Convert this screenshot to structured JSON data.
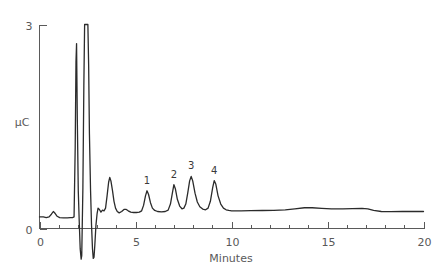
{
  "chart_data": {
    "type": "line",
    "title": "",
    "subtitle": "",
    "xlabel": "Minutes",
    "ylabel": "µC",
    "xlim": [
      0,
      20
    ],
    "ylim": [
      0,
      3
    ],
    "grid": false,
    "legend_position": "none",
    "x_ticks_major": [
      0,
      5,
      10,
      15,
      20
    ],
    "x_tick_labels": [
      "0",
      "5",
      "10",
      "15",
      "20"
    ],
    "x_ticks_minor_step": 1,
    "y_ticks_major": [
      0,
      3
    ],
    "y_tick_labels": [
      "0",
      "3"
    ],
    "series": [
      {
        "name": "detector-response",
        "units": "µC",
        "points": [
          [
            0.0,
            0.17
          ],
          [
            0.2,
            0.17
          ],
          [
            0.35,
            0.16
          ],
          [
            0.5,
            0.17
          ],
          [
            0.62,
            0.21
          ],
          [
            0.72,
            0.25
          ],
          [
            0.82,
            0.22
          ],
          [
            0.92,
            0.18
          ],
          [
            1.05,
            0.16
          ],
          [
            1.25,
            0.155
          ],
          [
            1.45,
            0.155
          ],
          [
            1.6,
            0.16
          ],
          [
            1.72,
            0.16
          ],
          [
            1.8,
            0.17
          ],
          [
            1.86,
            1.2
          ],
          [
            1.9,
            2.45
          ],
          [
            1.93,
            2.72
          ],
          [
            1.97,
            1.6
          ],
          [
            2.02,
            0.55
          ],
          [
            2.07,
            0.1
          ],
          [
            2.12,
            -0.3
          ],
          [
            2.17,
            -0.45
          ],
          [
            2.2,
            -0.4
          ],
          [
            2.26,
            0.6
          ],
          [
            2.31,
            2.1
          ],
          [
            2.35,
            3.0
          ],
          [
            2.52,
            3.0
          ],
          [
            2.56,
            2.4
          ],
          [
            2.6,
            1.4
          ],
          [
            2.66,
            0.55
          ],
          [
            2.71,
            0.05
          ],
          [
            2.76,
            -0.3
          ],
          [
            2.8,
            -0.44
          ],
          [
            2.84,
            -0.42
          ],
          [
            2.88,
            -0.25
          ],
          [
            2.94,
            0.05
          ],
          [
            3.0,
            0.22
          ],
          [
            3.05,
            0.3
          ],
          [
            3.12,
            0.28
          ],
          [
            3.2,
            0.24
          ],
          [
            3.28,
            0.27
          ],
          [
            3.36,
            0.26
          ],
          [
            3.44,
            0.3
          ],
          [
            3.52,
            0.48
          ],
          [
            3.6,
            0.68
          ],
          [
            3.66,
            0.75
          ],
          [
            3.72,
            0.7
          ],
          [
            3.8,
            0.56
          ],
          [
            3.88,
            0.4
          ],
          [
            3.96,
            0.3
          ],
          [
            4.05,
            0.25
          ],
          [
            4.15,
            0.23
          ],
          [
            4.28,
            0.25
          ],
          [
            4.4,
            0.28
          ],
          [
            4.52,
            0.28
          ],
          [
            4.62,
            0.26
          ],
          [
            4.75,
            0.24
          ],
          [
            4.9,
            0.235
          ],
          [
            5.05,
            0.235
          ],
          [
            5.2,
            0.24
          ],
          [
            5.32,
            0.26
          ],
          [
            5.42,
            0.34
          ],
          [
            5.52,
            0.48
          ],
          [
            5.6,
            0.555
          ],
          [
            5.68,
            0.5
          ],
          [
            5.78,
            0.38
          ],
          [
            5.88,
            0.3
          ],
          [
            6.0,
            0.265
          ],
          [
            6.15,
            0.25
          ],
          [
            6.35,
            0.245
          ],
          [
            6.55,
            0.25
          ],
          [
            6.7,
            0.27
          ],
          [
            6.82,
            0.36
          ],
          [
            6.92,
            0.52
          ],
          [
            7.0,
            0.645
          ],
          [
            7.08,
            0.58
          ],
          [
            7.18,
            0.43
          ],
          [
            7.3,
            0.33
          ],
          [
            7.42,
            0.29
          ],
          [
            7.52,
            0.3
          ],
          [
            7.62,
            0.36
          ],
          [
            7.72,
            0.52
          ],
          [
            7.82,
            0.7
          ],
          [
            7.9,
            0.765
          ],
          [
            7.98,
            0.7
          ],
          [
            8.1,
            0.52
          ],
          [
            8.22,
            0.39
          ],
          [
            8.35,
            0.32
          ],
          [
            8.5,
            0.285
          ],
          [
            8.65,
            0.275
          ],
          [
            8.78,
            0.3
          ],
          [
            8.9,
            0.4
          ],
          [
            9.02,
            0.6
          ],
          [
            9.1,
            0.705
          ],
          [
            9.18,
            0.655
          ],
          [
            9.3,
            0.48
          ],
          [
            9.44,
            0.36
          ],
          [
            9.58,
            0.3
          ],
          [
            9.72,
            0.275
          ],
          [
            9.86,
            0.265
          ],
          [
            10.0,
            0.26
          ],
          [
            10.5,
            0.26
          ],
          [
            11.0,
            0.262
          ],
          [
            11.6,
            0.265
          ],
          [
            12.2,
            0.268
          ],
          [
            12.8,
            0.275
          ],
          [
            13.3,
            0.29
          ],
          [
            13.8,
            0.305
          ],
          [
            14.2,
            0.305
          ],
          [
            14.7,
            0.295
          ],
          [
            15.2,
            0.288
          ],
          [
            15.8,
            0.288
          ],
          [
            16.3,
            0.292
          ],
          [
            16.8,
            0.295
          ],
          [
            17.1,
            0.29
          ],
          [
            17.4,
            0.265
          ],
          [
            17.8,
            0.25
          ],
          [
            18.3,
            0.248
          ],
          [
            18.9,
            0.25
          ],
          [
            19.4,
            0.25
          ],
          [
            20.0,
            0.25
          ]
        ]
      }
    ],
    "annotations": [
      {
        "label": "1",
        "x": 5.6,
        "y": 0.555
      },
      {
        "label": "2",
        "x": 7.0,
        "y": 0.645
      },
      {
        "label": "3",
        "x": 7.9,
        "y": 0.765
      },
      {
        "label": "4",
        "x": 9.1,
        "y": 0.705
      }
    ],
    "colors": {
      "background": "#ffffff",
      "trace": "#2b2b2b",
      "axis": "#5a5a5a",
      "label": "#595959"
    }
  }
}
